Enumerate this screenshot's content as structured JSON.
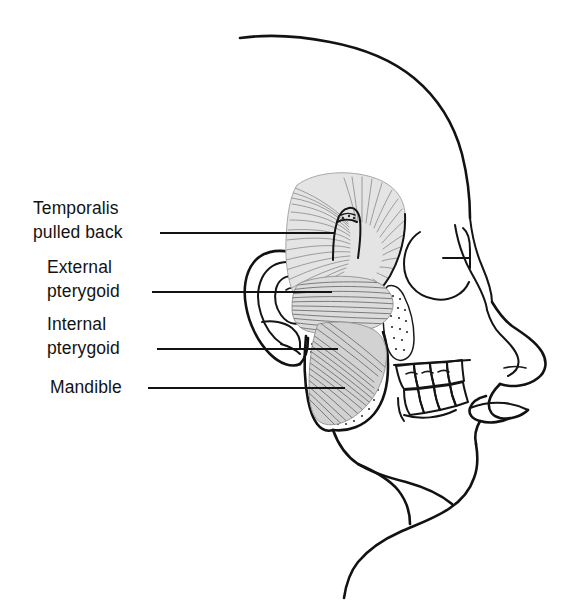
{
  "figure": {
    "background_color": "#ffffff",
    "line_color": "#121212",
    "muscle_tone_color": "#8e8e8e",
    "view": "right lateral profile, facing right"
  },
  "labels": [
    {
      "id": "temporalis",
      "line1": "Temporalis",
      "line2": "pulled back",
      "leader_y": 233,
      "leader_x_start": 160,
      "leader_x_end": 335,
      "text_x": 33,
      "text_y1": 214,
      "text_y2": 238
    },
    {
      "id": "external-pterygoid",
      "line1": "External",
      "line2": "pterygoid",
      "leader_y": 292,
      "leader_x_start": 152,
      "leader_x_end": 332,
      "text_x": 47,
      "text_y1": 273,
      "text_y2": 297
    },
    {
      "id": "internal-pterygoid",
      "line1": "Internal",
      "line2": "pterygoid",
      "leader_y": 349,
      "leader_x_start": 157,
      "leader_x_end": 338,
      "text_x": 47,
      "text_y1": 330,
      "text_y2": 354
    },
    {
      "id": "mandible",
      "line1": "Mandible",
      "line2": "",
      "leader_y": 388,
      "leader_x_start": 148,
      "leader_x_end": 345,
      "text_x": 50,
      "text_y1": 393,
      "text_y2": 0
    }
  ],
  "anatomy": {
    "parts": [
      "skull-outline",
      "forehead-brow",
      "eye-socket",
      "nose",
      "lips",
      "chin",
      "neck",
      "ear",
      "temporalis-muscle",
      "external-pterygoid-muscle",
      "internal-pterygoid-muscle",
      "mandible-ramus",
      "coronoid-process",
      "upper-teeth",
      "lower-teeth"
    ]
  }
}
